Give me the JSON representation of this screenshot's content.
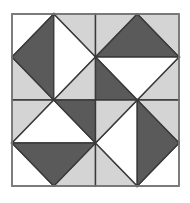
{
  "figure": {
    "canvas": {
      "width": 190,
      "height": 203
    },
    "background_color": "#ffffff"
  },
  "palette": {
    "dark": "#5a5a5a",
    "light": "#d4d4d4",
    "white": "#ffffff",
    "outline": "#3a3a3a",
    "frame": "#808080",
    "background": "#ffffff"
  },
  "block": {
    "x": 12,
    "y": 14,
    "width": 167,
    "height": 172,
    "frame_stroke_width": 1.5,
    "outline_stroke_width": 1.4,
    "grid_rows": 2,
    "grid_cols": 2
  },
  "quadrants": [
    {
      "name": "top-left",
      "row": 0,
      "col": 0,
      "diamond_split": "vertical",
      "diamond_halves": [
        "dark",
        "white"
      ],
      "corners": {
        "tl": "white",
        "tr": "light",
        "bl": "light",
        "br": "white"
      }
    },
    {
      "name": "top-right",
      "row": 0,
      "col": 1,
      "diamond_split": "horizontal",
      "diamond_halves": [
        "dark",
        "white"
      ],
      "corners": {
        "tl": "light",
        "tr": "light",
        "bl": "light",
        "br": "light"
      }
    },
    {
      "name": "bottom-left",
      "row": 1,
      "col": 0,
      "diamond_split": "horizontal",
      "diamond_halves": [
        "white",
        "dark"
      ],
      "corners": {
        "tl": "light",
        "tr": "light",
        "bl": "white",
        "br": "light"
      }
    },
    {
      "name": "bottom-right",
      "row": 1,
      "col": 1,
      "diamond_split": "vertical",
      "diamond_halves": [
        "white",
        "dark"
      ],
      "corners": {
        "tl": "light",
        "tr": "light",
        "bl": "light",
        "br": "white"
      }
    }
  ],
  "center_pinwheel": {
    "name": "center-diamond",
    "radius_ratio": 0.5,
    "triangles": [
      {
        "position": "top-left",
        "color": "light"
      },
      {
        "position": "top-right",
        "color": "dark"
      },
      {
        "position": "bottom-left",
        "color": "dark"
      },
      {
        "position": "bottom-right",
        "color": "light"
      }
    ]
  }
}
